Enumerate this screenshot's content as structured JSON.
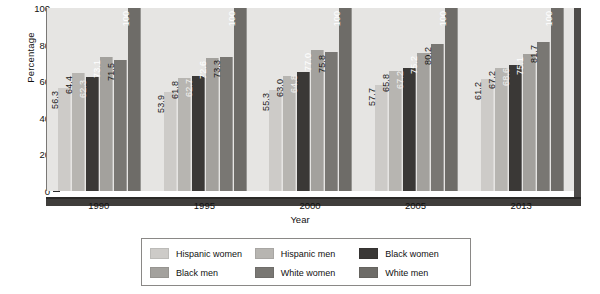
{
  "chart_data": {
    "type": "bar",
    "title": "",
    "xlabel": "Year",
    "ylabel": "Percentage",
    "categories": [
      "1990",
      "1995",
      "2000",
      "2005",
      "2013"
    ],
    "ylim": [
      0,
      100
    ],
    "yticks": [
      0,
      20,
      40,
      60,
      80,
      100
    ],
    "grid": false,
    "legend_position": "bottom",
    "value_labels": true,
    "value_label_rotation": -90,
    "series": [
      {
        "name": "Hispanic women",
        "color": "#cdcbc8",
        "values": [
          56.3,
          53.9,
          55.3,
          57.7,
          61.2
        ],
        "labels": [
          "56.3",
          "53.9",
          "55.3",
          "57.7",
          "61.2"
        ],
        "label_color": "#1a1a1a"
      },
      {
        "name": "Hispanic men",
        "color": "#b7b5b1",
        "values": [
          64.4,
          61.8,
          63.0,
          65.8,
          67.2
        ],
        "labels": [
          "64.4",
          "61.8",
          "63.0",
          "65.8",
          "67.2"
        ],
        "label_color": "#1a1a1a"
      },
      {
        "name": "Black women",
        "color": "#3a3836",
        "values": [
          62.3,
          62.7,
          64.8,
          67.2,
          68.6
        ],
        "labels": [
          "62.3",
          "62.7",
          "64.8",
          "67.2",
          "68.6"
        ],
        "label_color": "#f2f1ef"
      },
      {
        "name": "Black men",
        "color": "#a3a19d",
        "values": [
          73.1,
          72.6,
          77.0,
          75.2,
          75.1
        ],
        "labels": [
          "73.1",
          "72.6",
          "77.0",
          "75.2",
          "75.1"
        ],
        "label_color": "#ffffff"
      },
      {
        "name": "White women",
        "color": "#797773",
        "values": [
          71.5,
          73.3,
          75.8,
          80.2,
          81.7
        ],
        "labels": [
          "71.5",
          "73.3",
          "75.8",
          "80.2",
          "81.7"
        ],
        "label_color": "#1a1a1a"
      },
      {
        "name": "White men",
        "color": "#6e6c68",
        "values": [
          100,
          100,
          100,
          100,
          100
        ],
        "labels": [
          "100",
          "100",
          "100",
          "100",
          "100"
        ],
        "label_color": "#ffffff"
      }
    ]
  },
  "legend": {
    "rows": [
      [
        "Hispanic women",
        "Hispanic men",
        "Black women"
      ],
      [
        "Black men",
        "White women",
        "White men"
      ]
    ]
  },
  "colors": {
    "plot_background": "#e6e5e3",
    "axis": "#2c2c2c",
    "baseline": "#3f3d3b",
    "shadow": "#4d4b49",
    "page_background": "#ffffff"
  }
}
